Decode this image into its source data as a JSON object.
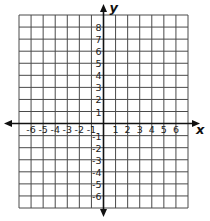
{
  "diagram": {
    "type": "coordinate-grid",
    "x_axis": {
      "title": "x",
      "range": [
        -7,
        7
      ],
      "tick_labels": [
        "-6",
        "-5",
        "-4",
        "-3",
        "-2",
        "-1",
        "1",
        "2",
        "3",
        "4",
        "5",
        "6"
      ],
      "tick_values": [
        -6,
        -5,
        -4,
        -3,
        -2,
        -1,
        1,
        2,
        3,
        4,
        5,
        6
      ]
    },
    "y_axis": {
      "title": "y",
      "range": [
        -7,
        9
      ],
      "tick_labels": [
        "8",
        "7",
        "6",
        "5",
        "4",
        "3",
        "2",
        "1",
        "-1",
        "-2",
        "-3",
        "-4",
        "-5",
        "-6"
      ],
      "tick_values": [
        8,
        7,
        6,
        5,
        4,
        3,
        2,
        1,
        -1,
        -2,
        -3,
        -4,
        -5,
        -6
      ]
    },
    "grid": true,
    "colors": {
      "grid": "#4a4a4a",
      "axis": "#111111"
    }
  }
}
